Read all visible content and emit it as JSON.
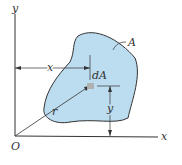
{
  "diagram": {
    "labels": {
      "y_axis": "y",
      "x_axis": "x",
      "origin": "O",
      "area": "A",
      "element": "dA",
      "x_distance": "x",
      "y_distance": "y",
      "radius": "r"
    },
    "colors": {
      "area_fill": "#bcdcef",
      "outline": "#333333",
      "element_fill": "#b0b0b0"
    }
  }
}
